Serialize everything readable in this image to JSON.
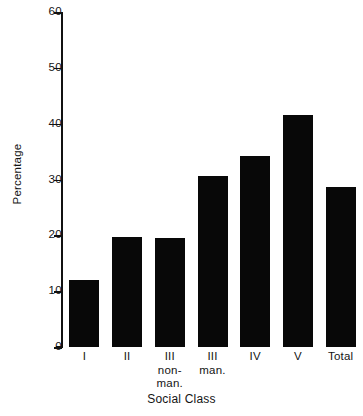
{
  "chart_data": {
    "type": "bar",
    "title": "",
    "xlabel": "Social Class",
    "ylabel": "Percentage",
    "categories": [
      "I",
      "II",
      "III non-man.",
      "III man.",
      "IV",
      "V",
      "Total"
    ],
    "category_lines": [
      [
        "I"
      ],
      [
        "II"
      ],
      [
        "III",
        "non-",
        "man."
      ],
      [
        "III",
        "man."
      ],
      [
        "IV"
      ],
      [
        "V"
      ],
      [
        "Total"
      ]
    ],
    "values": [
      12.0,
      19.7,
      19.6,
      30.6,
      34.3,
      41.5,
      28.6
    ],
    "ylim": [
      0,
      60
    ],
    "yticks": [
      0,
      10,
      20,
      30,
      40,
      50,
      60
    ],
    "ytick_labels": [
      "0",
      "10",
      "20",
      "30",
      "40",
      "50",
      "60"
    ],
    "grid": false,
    "legend": null,
    "bar_color": "#080808",
    "axis_color": "#111111"
  }
}
